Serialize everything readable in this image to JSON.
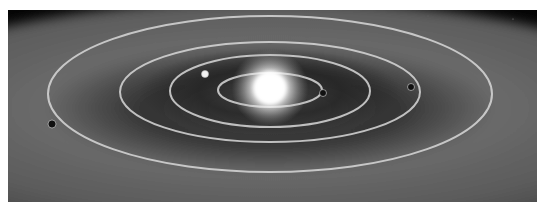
{
  "scene": {
    "description": "Grayscale illustration of a planetary system with a bright central star and four concentric elliptical orbits",
    "colors": {
      "space": "#0a0a0a",
      "disk_inner": "#3a3a3a",
      "disk_outer": "#5e5e5e",
      "orbit_line": "#d8d8d8",
      "star_core": "#ffffff",
      "planet_light": "#f2f2f2",
      "planet_dark": "#111111"
    },
    "star": {
      "cx": 262,
      "cy": 78,
      "r": 16
    },
    "orbits": [
      {
        "name": "orbit-1",
        "cx": 262,
        "cy": 80,
        "rx": 52,
        "ry": 17
      },
      {
        "name": "orbit-2",
        "cx": 262,
        "cy": 81,
        "rx": 100,
        "ry": 36
      },
      {
        "name": "orbit-3",
        "cx": 262,
        "cy": 82,
        "rx": 150,
        "ry": 50
      },
      {
        "name": "orbit-4",
        "cx": 262,
        "cy": 84,
        "rx": 222,
        "ry": 78
      }
    ],
    "planets": [
      {
        "name": "planet-1",
        "orbit": 1,
        "cx": 315,
        "cy": 83,
        "r": 3.5,
        "tone": "dark"
      },
      {
        "name": "planet-2",
        "orbit": 2,
        "cx": 197,
        "cy": 64,
        "r": 3.5,
        "tone": "light"
      },
      {
        "name": "planet-3",
        "orbit": 3,
        "cx": 403,
        "cy": 77,
        "r": 3.5,
        "tone": "dark"
      },
      {
        "name": "planet-4",
        "orbit": 4,
        "cx": 44,
        "cy": 114,
        "r": 4,
        "tone": "dark"
      }
    ]
  }
}
